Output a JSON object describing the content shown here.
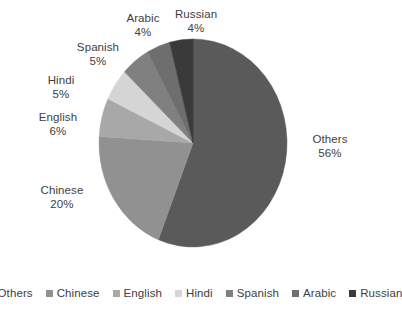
{
  "chart_data": {
    "type": "pie",
    "title": "",
    "categories": [
      "Others",
      "Chinese",
      "English",
      "Hindi",
      "Spanish",
      "Arabic",
      "Russian"
    ],
    "values": [
      56,
      20,
      6,
      5,
      5,
      4,
      4
    ],
    "value_unit": "%",
    "colors": [
      "#5a5a5a",
      "#919191",
      "#a8a8a8",
      "#d5d5d5",
      "#808080",
      "#6e6e6e",
      "#3a3a3a"
    ],
    "start_angle_deg": 0,
    "direction": "clockwise",
    "legend_position": "bottom",
    "grid": false,
    "slices": [
      {
        "label": "Others",
        "value": 56,
        "value_text": "56%",
        "color": "#5a5a5a"
      },
      {
        "label": "Chinese",
        "value": 20,
        "value_text": "20%",
        "color": "#919191"
      },
      {
        "label": "English",
        "value": 6,
        "value_text": "6%",
        "color": "#a8a8a8"
      },
      {
        "label": "Hindi",
        "value": 5,
        "value_text": "5%",
        "color": "#d5d5d5"
      },
      {
        "label": "Spanish",
        "value": 5,
        "value_text": "5%",
        "color": "#808080"
      },
      {
        "label": "Arabic",
        "value": 4,
        "value_text": "4%",
        "color": "#6e6e6e"
      },
      {
        "label": "Russian",
        "value": 4,
        "value_text": "4%",
        "color": "#3a3a3a"
      }
    ]
  },
  "labels": [
    {
      "name": "Others",
      "pct": "56%",
      "x": 330,
      "y": 133,
      "anchor": "center"
    },
    {
      "name": "Chinese",
      "pct": "20%",
      "x": 62,
      "y": 184,
      "anchor": "center"
    },
    {
      "name": "English",
      "pct": "6%",
      "x": 58,
      "y": 111,
      "anchor": "center"
    },
    {
      "name": "Hindi",
      "pct": "5%",
      "x": 61,
      "y": 74,
      "anchor": "center"
    },
    {
      "name": "Spanish",
      "pct": "5%",
      "x": 98,
      "y": 41,
      "anchor": "center"
    },
    {
      "name": "Arabic",
      "pct": "4%",
      "x": 143,
      "y": 12,
      "anchor": "center"
    },
    {
      "name": "Russian",
      "pct": "4%",
      "x": 196,
      "y": 8,
      "anchor": "center"
    }
  ],
  "legend": {
    "items": [
      {
        "label": "Others",
        "color": "#5a5a5a"
      },
      {
        "label": "Chinese",
        "color": "#919191"
      },
      {
        "label": "English",
        "color": "#a8a8a8"
      },
      {
        "label": "Hindi",
        "color": "#d5d5d5"
      },
      {
        "label": "Spanish",
        "color": "#808080"
      },
      {
        "label": "Arabic",
        "color": "#6e6e6e"
      },
      {
        "label": "Russian",
        "color": "#3a3a3a"
      }
    ]
  },
  "geometry": {
    "cx": 193,
    "cy": 143,
    "rx": 94,
    "ry": 104
  }
}
